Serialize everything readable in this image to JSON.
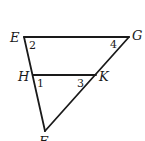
{
  "diagram": {
    "type": "triangle-with-parallel-segment",
    "points": {
      "E": {
        "x": 24,
        "y": 37
      },
      "G": {
        "x": 129,
        "y": 37
      },
      "H": {
        "x": 33,
        "y": 75
      },
      "K": {
        "x": 96,
        "y": 75
      },
      "F": {
        "x": 45,
        "y": 131
      }
    },
    "vertex_labels": {
      "E": "E",
      "G": "G",
      "H": "H",
      "K": "K",
      "F": "F"
    },
    "angle_labels": {
      "a1": "1",
      "a2": "2",
      "a3": "3",
      "a4": "4"
    },
    "segments": [
      "EG",
      "EF",
      "GF",
      "HK"
    ],
    "stroke_color": "#1a1a1a",
    "background": "#ffffff"
  }
}
